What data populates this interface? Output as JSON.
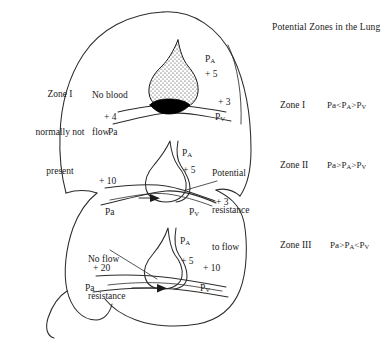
{
  "title": "Potential Zones in the Lung",
  "left_note": {
    "line1": "Zone I",
    "line2": "normally not",
    "line3": "present"
  },
  "legend": [
    {
      "name": "Zone I",
      "formula_pa": "Pa",
      "op1": "<",
      "formula_palv": "P",
      "sub_palv": "A",
      "op2": ">",
      "formula_pv": "P",
      "sub_pv": "V",
      "formula": "Pa<PA>PV"
    },
    {
      "name": "Zone II",
      "formula_pa": "Pa",
      "op1": ">",
      "formula_palv": "P",
      "sub_palv": "A",
      "op2": ">",
      "formula_pv": "P",
      "sub_pv": "V",
      "formula": "Pa>PA>PV"
    },
    {
      "name": "Zone III",
      "formula_pa": "Pa",
      "op1": ">",
      "formula_palv": "P",
      "sub_palv": "A",
      "op2": "<",
      "formula_pv": "P",
      "sub_pv": "V",
      "formula": "Pa>PA<PV"
    }
  ],
  "zones": [
    {
      "id": "zone-1",
      "status_line1": "No blood",
      "status_line2": "flow",
      "alveolar_label": "P",
      "alveolar_sub": "A",
      "alveolar_value": "+ 5",
      "arterial_value": "+ 4",
      "arterial_label": "Pa",
      "venous_value": "+ 3",
      "venous_label": "P",
      "venous_sub": "V"
    },
    {
      "id": "zone-2",
      "status_line1": "Potential",
      "status_line2": "resistance",
      "status_line3": "to flow",
      "alveolar_label": "P",
      "alveolar_sub": "A",
      "alveolar_value": "+ 5",
      "arterial_value": "+ 10",
      "arterial_label": "Pa",
      "venous_value": "+ 3",
      "venous_label": "P",
      "venous_sub": "V"
    },
    {
      "id": "zone-3",
      "status_line1": "No flow",
      "status_line2": "resistance",
      "alveolar_label": "P",
      "alveolar_sub": "A",
      "alveolar_value": "+ 5",
      "arterial_value": "+ 20",
      "arterial_label": "Pa",
      "venous_value": "+ 10",
      "venous_label": "P",
      "venous_sub": "V"
    }
  ],
  "colors": {
    "ink": "#1a1a1a",
    "stroke": "#2b2b2b",
    "background": "#ffffff",
    "collapsed_vessel": "#000000"
  }
}
